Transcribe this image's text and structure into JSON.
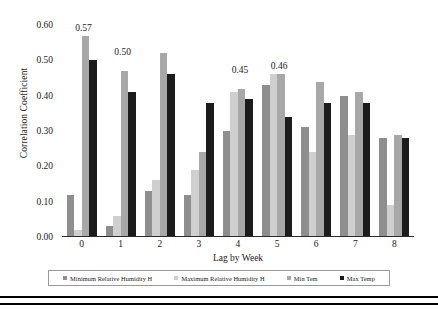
{
  "chart_data": {
    "type": "bar",
    "title": "",
    "xlabel": "Lag by Week",
    "ylabel": "Correlation Coefficient",
    "categories": [
      "0",
      "1",
      "2",
      "3",
      "4",
      "5",
      "6",
      "7",
      "8"
    ],
    "ylim": [
      0.0,
      0.6
    ],
    "yticks": [
      "0.00",
      "0.10",
      "0.20",
      "0.30",
      "0.40",
      "0.50",
      "0.60"
    ],
    "ytick_values": [
      0.0,
      0.1,
      0.2,
      0.3,
      0.4,
      0.5,
      0.6
    ],
    "grid": false,
    "legend_position": "bottom",
    "series": [
      {
        "name": "Minimum Relative Humidity H",
        "color": "#8e8e8e",
        "values": [
          0.12,
          0.03,
          0.13,
          0.12,
          0.3,
          0.43,
          0.31,
          0.4,
          0.28
        ]
      },
      {
        "name": "Maximum Relative Humidity H",
        "color": "#cfcfcf",
        "values": [
          0.02,
          0.06,
          0.16,
          0.19,
          0.41,
          0.46,
          0.24,
          0.29,
          0.09
        ]
      },
      {
        "name": "Min Tem",
        "color": "#a8a8a8",
        "values": [
          0.57,
          0.47,
          0.52,
          0.24,
          0.42,
          0.46,
          0.44,
          0.41,
          0.29
        ]
      },
      {
        "name": "Max Temp",
        "color": "#1c1c1c",
        "values": [
          0.5,
          0.41,
          0.46,
          0.38,
          0.39,
          0.34,
          0.38,
          0.38,
          0.28
        ]
      }
    ],
    "annotations": [
      {
        "text": "0.57",
        "category": "0",
        "value": 0.57
      },
      {
        "text": "0.50",
        "category": "1",
        "value": 0.5
      },
      {
        "text": "0.45",
        "category": "4",
        "value": 0.45
      },
      {
        "text": "0.46",
        "category": "5",
        "value": 0.46
      }
    ]
  },
  "legend": {
    "items": [
      {
        "label": "Minimum Relative Humidity H",
        "color": "#8e8e8e"
      },
      {
        "label": "Maximum Relative Humidity H",
        "color": "#cfcfcf"
      },
      {
        "label": "Min Tem",
        "color": "#a8a8a8"
      },
      {
        "label": "Max Temp",
        "color": "#1c1c1c"
      }
    ]
  }
}
